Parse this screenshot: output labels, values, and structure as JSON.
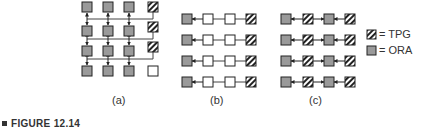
{
  "figure": {
    "label": "FIGURE 12.14",
    "panels": [
      {
        "id": "a",
        "caption": "(a)"
      },
      {
        "id": "b",
        "caption": "(b)"
      },
      {
        "id": "c",
        "caption": "(c)"
      }
    ],
    "legend": [
      {
        "symbol": "hatched-square",
        "label": "= TPG"
      },
      {
        "symbol": "gray-square",
        "label": "= ORA"
      }
    ],
    "colors": {
      "ora_fill": "#9a9a9a",
      "tpg_fill": "#ffffff",
      "hatch": "#222222",
      "stroke": "#222222",
      "line": "#444444",
      "empty_fill": "#ffffff"
    }
  }
}
